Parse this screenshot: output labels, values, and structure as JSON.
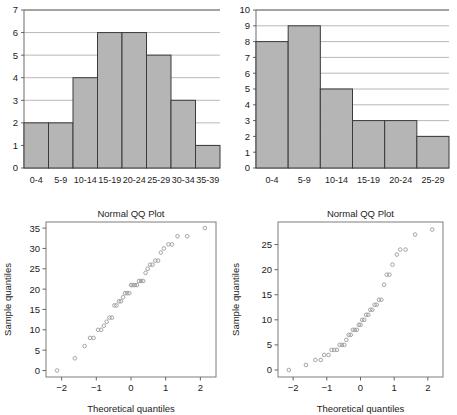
{
  "figure": {
    "background": "#ffffff",
    "bar_fill": "#b5b5b5",
    "bar_stroke": "#3a3a3a",
    "point_stroke": "#9a9a9a",
    "grid_color": "#9a9a9a"
  },
  "panels": {
    "top_left": {
      "name": "histogram-left"
    },
    "top_right": {
      "name": "histogram-right"
    },
    "bottom_left": {
      "name": "qq-plot-left"
    },
    "bottom_right": {
      "name": "qq-plot-right"
    }
  },
  "chart_data": [
    {
      "type": "bar",
      "panel": "top-left",
      "title": "",
      "xlabel": "",
      "ylabel": "",
      "grid": true,
      "legend": "none",
      "categories": [
        "0-4",
        "5-9",
        "10-14",
        "15-19",
        "20-24",
        "25-29",
        "30-34",
        "35-39"
      ],
      "values": [
        2,
        2,
        4,
        6,
        6,
        5,
        3,
        1
      ],
      "yticks": [
        0,
        1,
        2,
        3,
        4,
        5,
        6,
        7
      ],
      "ylim": [
        0,
        7
      ]
    },
    {
      "type": "bar",
      "panel": "top-right",
      "title": "",
      "xlabel": "",
      "ylabel": "",
      "grid": true,
      "legend": "none",
      "categories": [
        "0-4",
        "5-9",
        "10-14",
        "15-19",
        "20-24",
        "25-29"
      ],
      "values": [
        8,
        9,
        5,
        3,
        3,
        2
      ],
      "yticks": [
        0,
        1,
        2,
        3,
        4,
        5,
        6,
        7,
        8,
        9,
        10
      ],
      "ylim": [
        0,
        10
      ]
    },
    {
      "type": "scatter",
      "panel": "bottom-left",
      "title": "Normal QQ Plot",
      "xlabel": "Theoretical quantiles",
      "ylabel": "Sample quantiles",
      "grid": false,
      "legend": "none",
      "xticks": [
        -2,
        -1,
        0,
        1,
        2
      ],
      "yticks": [
        0,
        5,
        10,
        15,
        20,
        25,
        30,
        35
      ],
      "xlim": [
        -2.45,
        2.45
      ],
      "ylim": [
        -1.6,
        36.5
      ],
      "x": [
        -2.13,
        -1.62,
        -1.34,
        -1.18,
        -1.08,
        -0.95,
        -0.86,
        -0.78,
        -0.7,
        -0.62,
        -0.55,
        -0.48,
        -0.42,
        -0.35,
        -0.29,
        -0.23,
        -0.17,
        -0.11,
        -0.05,
        0.0,
        0.05,
        0.11,
        0.17,
        0.23,
        0.29,
        0.35,
        0.42,
        0.48,
        0.55,
        0.62,
        0.7,
        0.78,
        0.86,
        0.95,
        1.08,
        1.18,
        1.34,
        1.62,
        2.13
      ],
      "y": [
        0,
        3,
        6,
        8,
        8,
        10,
        10,
        11,
        12,
        13,
        13,
        16,
        16,
        17,
        17,
        18,
        19,
        19,
        19,
        21,
        21,
        21,
        21,
        22,
        22,
        22,
        24,
        25,
        26,
        26,
        27,
        27,
        29,
        30,
        31,
        31,
        33,
        33,
        35
      ]
    },
    {
      "type": "scatter",
      "panel": "bottom-right",
      "title": "Normal QQ Plot",
      "xlabel": "Theoretical quantiles",
      "ylabel": "Sample quantiles",
      "grid": false,
      "legend": "none",
      "xticks": [
        -2,
        -1,
        0,
        1,
        2
      ],
      "yticks": [
        0,
        5,
        10,
        15,
        20,
        25
      ],
      "xlim": [
        -2.45,
        2.45
      ],
      "ylim": [
        -1.4,
        29.5
      ],
      "x": [
        -2.13,
        -1.62,
        -1.34,
        -1.18,
        -1.08,
        -0.95,
        -0.86,
        -0.78,
        -0.7,
        -0.62,
        -0.55,
        -0.48,
        -0.42,
        -0.35,
        -0.29,
        -0.23,
        -0.17,
        -0.11,
        -0.05,
        0.0,
        0.05,
        0.11,
        0.17,
        0.23,
        0.29,
        0.35,
        0.42,
        0.48,
        0.55,
        0.62,
        0.7,
        0.78,
        0.86,
        0.95,
        1.08,
        1.18,
        1.34,
        1.62,
        2.13
      ],
      "y": [
        0,
        1,
        2,
        2,
        3,
        3,
        4,
        4,
        4,
        5,
        5,
        5,
        6,
        7,
        7,
        8,
        8,
        8,
        9,
        9,
        10,
        10,
        11,
        11,
        12,
        12,
        13,
        13,
        14,
        14,
        17,
        19,
        19,
        21,
        23,
        24,
        24,
        27,
        28
      ]
    }
  ]
}
